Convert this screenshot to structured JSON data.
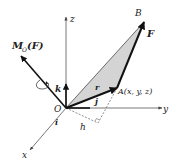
{
  "figure": {
    "labels": {
      "z_axis": "z",
      "y_axis": "y",
      "x_axis": "x",
      "origin": "O",
      "point_b": "B",
      "point_a": "A(x, y, z)",
      "force": "F",
      "position_vector": "r",
      "unit_i": "i",
      "unit_j": "j",
      "unit_k": "k",
      "moment_main": "M",
      "moment_sub": "O",
      "moment_arg": "(F)",
      "lever_arm": "h"
    },
    "colors": {
      "triangle_fill": "#d4d4d4",
      "stroke": "#1a1a1a",
      "axis": "#555555",
      "background": "#ffffff"
    }
  }
}
